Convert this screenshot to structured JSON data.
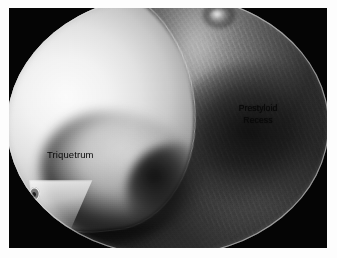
{
  "figure": {
    "name": "wrist-arthroscopy-view",
    "modality": "arthroscopy",
    "frame_background_color": "#050505",
    "matte_color": "#fdfdfd"
  },
  "scope": {
    "name": "arthroscope-circular-field",
    "shape": "circle",
    "rim_color": "#e1e1e1"
  },
  "annotations": [
    {
      "id": "triquetrum",
      "label": "Triquetrum",
      "lines": [
        "Triquetrum"
      ],
      "color": "#080808",
      "x": 38,
      "y": 141
    },
    {
      "id": "prestyloid-recess",
      "label": "Prestyloid Recess",
      "lines": [
        "Prestyloid",
        "Recess"
      ],
      "color": "#0a0a0a",
      "x": 224,
      "y": 95
    }
  ],
  "structures": {
    "triquetrum": {
      "name": "triquetrum-bone",
      "appearance": "bright cartilage-covered convex bone surface, left half of field"
    },
    "prestyloid_recess": {
      "name": "prestyloid-recess-cavity",
      "appearance": "dark synovial recess with fibrous striations, right half of field"
    },
    "specular_highlight": {
      "name": "light-reflection-highlight",
      "appearance": "small bright specular reflection near superior margin"
    },
    "bubble_artifact": {
      "name": "fluid-bubble-artifact",
      "appearance": "small ringed dark oval on inferior bone margin"
    }
  }
}
